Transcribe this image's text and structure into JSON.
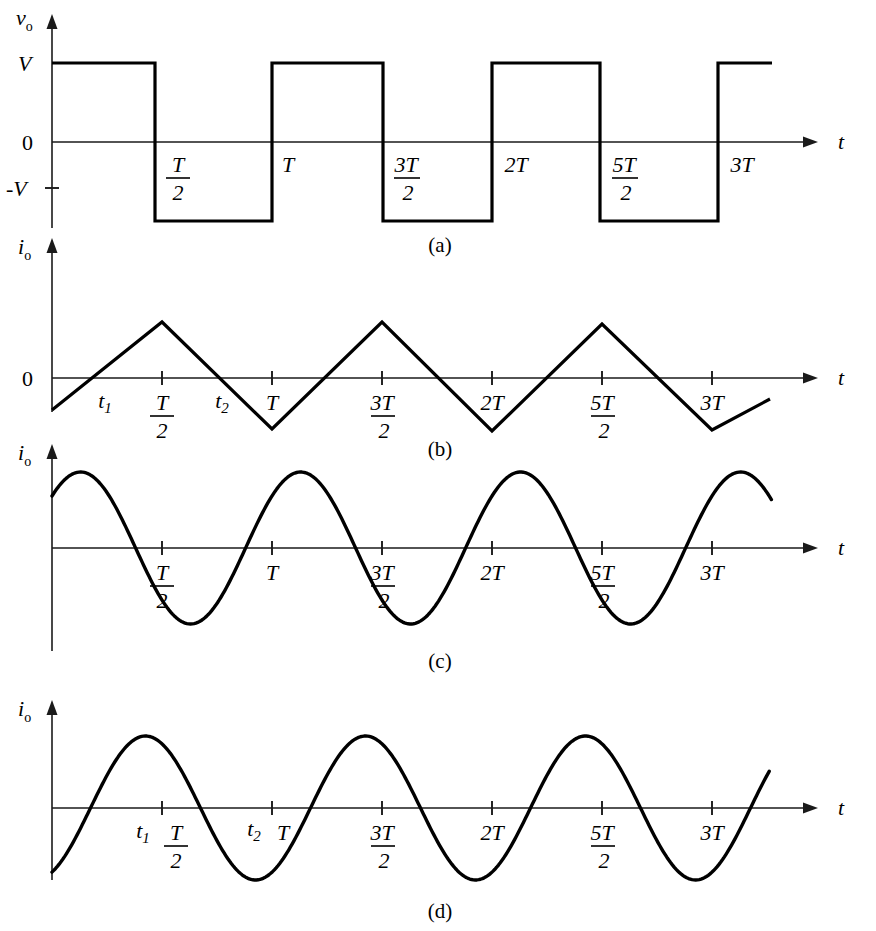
{
  "figure": {
    "axis_color": "#1a1a1a",
    "curve_color": "#000000",
    "background": "#ffffff"
  },
  "chart_data": [
    {
      "id": "panel-a",
      "type": "line",
      "caption": "(a)",
      "ylabel_main": "v",
      "ylabel_sub": "o",
      "xlabel": "t",
      "grid": false,
      "legend": "none",
      "y_tick_labels": [
        "V",
        "0",
        "-V"
      ],
      "y_tick_values": [
        1,
        0,
        -1
      ],
      "x_tick_labels": [
        "T/2",
        "T",
        "3T/2",
        "2T",
        "5T/2",
        "3T"
      ],
      "x_tick_numer": [
        "T",
        "T",
        "3T",
        "2T",
        "5T",
        "3T"
      ],
      "x_tick_denom": [
        "2",
        "",
        "2",
        "",
        "2",
        ""
      ],
      "x_tick_values": [
        0.5,
        1.0,
        1.5,
        2.0,
        2.5,
        3.0
      ],
      "xlim": [
        0,
        3.45
      ],
      "ylim": [
        -1.35,
        1.35
      ],
      "description": "Square wave output voltage alternating between +V and -V with period T",
      "x": [
        0,
        0.5,
        0.5,
        1.0,
        1.0,
        1.5,
        1.5,
        2.0,
        2.0,
        2.5,
        2.5,
        3.0,
        3.0,
        3.2
      ],
      "y": [
        1,
        1,
        -1,
        -1,
        1,
        1,
        -1,
        -1,
        1,
        1,
        -1,
        -1,
        1,
        1
      ]
    },
    {
      "id": "panel-b",
      "type": "line",
      "caption": "(b)",
      "ylabel_main": "i",
      "ylabel_sub": "o",
      "xlabel": "t",
      "grid": false,
      "legend": "none",
      "y_tick_labels": [
        "0"
      ],
      "y_tick_values": [
        0
      ],
      "x_tick_labels": [
        "t1",
        "T/2",
        "t2",
        "T",
        "3T/2",
        "2T",
        "5T/2",
        "3T"
      ],
      "x_tick_numer": [
        "T",
        "3T",
        "2T",
        "5T",
        "3T"
      ],
      "x_tick_denom": [
        "2",
        "2",
        "",
        "2",
        ""
      ],
      "x_tick_values": [
        0.5,
        1.0,
        1.5,
        2.0,
        2.5,
        3.0
      ],
      "annotations": [
        "t1",
        "t2"
      ],
      "annotation_values": [
        0.2,
        0.74
      ],
      "xlim": [
        0,
        3.45
      ],
      "ylim": [
        -1.35,
        1.35
      ],
      "description": "Triangular current waveform, zero crossings at t1 and t2, peaks at T/2, 3T/2, 5T/2",
      "x": [
        0,
        0.5,
        1.0,
        1.5,
        2.0,
        2.5,
        3.0,
        3.25
      ],
      "y": [
        -0.5,
        1.0,
        -1.0,
        1.0,
        -1.0,
        0.97,
        -0.93,
        -0.35
      ]
    },
    {
      "id": "panel-c",
      "type": "line",
      "caption": "(c)",
      "ylabel_main": "i",
      "ylabel_sub": "o",
      "xlabel": "t",
      "grid": false,
      "legend": "none",
      "y_tick_labels": [],
      "y_tick_values": [],
      "x_tick_labels": [
        "T/2",
        "T",
        "3T/2",
        "2T",
        "5T/2",
        "3T"
      ],
      "x_tick_numer": [
        "T",
        "T",
        "3T",
        "2T",
        "5T",
        "3T"
      ],
      "x_tick_denom": [
        "2",
        "",
        "2",
        "",
        "2",
        ""
      ],
      "x_tick_values": [
        0.5,
        1.0,
        1.5,
        2.0,
        2.5,
        3.0
      ],
      "xlim": [
        0,
        3.45
      ],
      "ylim": [
        -1.35,
        1.35
      ],
      "description": "Sinusoidal current waveform starting negative, lagging the voltage, peaks just before T/2",
      "phase_offset": -0.12,
      "amplitude": 1.0,
      "period": 1.0
    },
    {
      "id": "panel-d",
      "type": "line",
      "caption": "(d)",
      "ylabel_main": "i",
      "ylabel_sub": "o",
      "xlabel": "t",
      "grid": false,
      "legend": "none",
      "y_tick_labels": [],
      "y_tick_values": [],
      "x_tick_labels": [
        "t1",
        "T/2",
        "t2",
        "T",
        "3T/2",
        "2T",
        "5T/2",
        "3T"
      ],
      "x_tick_numer": [
        "T",
        "T",
        "3T",
        "2T",
        "5T",
        "3T"
      ],
      "x_tick_denom": [
        "2",
        "",
        "2",
        "",
        "2",
        ""
      ],
      "x_tick_values": [
        0.5,
        1.0,
        1.5,
        2.0,
        2.5,
        3.0
      ],
      "annotations": [
        "t1",
        "t2"
      ],
      "annotation_values": [
        0.41,
        0.94
      ],
      "xlim": [
        0,
        3.45
      ],
      "ylim": [
        -1.35,
        1.35
      ],
      "description": "Sinusoidal current waveform starting positive, leading, zero crossings at t1 and t2",
      "phase_offset": 0.175,
      "amplitude": 1.0,
      "period": 1.0
    }
  ]
}
